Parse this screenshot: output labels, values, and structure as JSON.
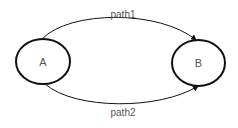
{
  "diagram": {
    "nodes": [
      {
        "id": "A",
        "label": "A"
      },
      {
        "id": "B",
        "label": "B"
      }
    ],
    "edges": [
      {
        "from": "A",
        "to": "B",
        "label": "path1"
      },
      {
        "from": "A",
        "to": "B",
        "label": "path2"
      }
    ],
    "colors": {
      "stroke": "#111111",
      "text": "#555555",
      "background": "#ffffff"
    }
  }
}
